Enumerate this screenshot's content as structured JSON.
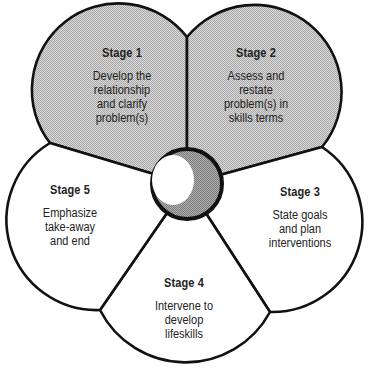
{
  "diagram": {
    "type": "cycle-flower",
    "colors": {
      "outline": "#111111",
      "shaded_fill": "#c8c8c8",
      "plain_fill": "#ffffff",
      "hub_fill": "#9a9a9a",
      "hub_highlight": "#ffffff"
    },
    "hub": {
      "icon": "sphere-hub-icon"
    },
    "stages": [
      {
        "title": "Stage 1",
        "description": "Develop the\nrelationship\nand clarify\nproblem(s)",
        "shaded": true
      },
      {
        "title": "Stage 2",
        "description": "Assess and\nrestate\nproblem(s) in\nskills terms",
        "shaded": true
      },
      {
        "title": "Stage 3",
        "description": "State goals\nand plan\ninterventions",
        "shaded": false
      },
      {
        "title": "Stage 4",
        "description": "Intervene to\ndevelop\nlifeskills",
        "shaded": false
      },
      {
        "title": "Stage 5",
        "description": "Emphasize\ntake-away\nand end",
        "shaded": false
      }
    ]
  }
}
